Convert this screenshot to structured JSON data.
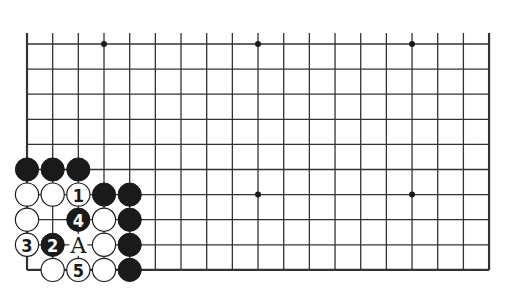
{
  "diagram": {
    "type": "go-board",
    "columns": 19,
    "visible_rows": 10,
    "origin_x": 27,
    "origin_y": 44,
    "spacing_x": 25.67,
    "spacing_y": 25.1,
    "line_top_extension": 11,
    "colors": {
      "line": "#333333",
      "black": "#1a1a1a",
      "white": "#ffffff",
      "background": "#ffffff"
    },
    "star_points": [
      {
        "col": 3,
        "row": 0
      },
      {
        "col": 9,
        "row": 0
      },
      {
        "col": 15,
        "row": 0
      },
      {
        "col": 9,
        "row": 6
      },
      {
        "col": 15,
        "row": 6
      }
    ],
    "stones": [
      {
        "col": 0,
        "row": 5,
        "color": "black",
        "label": ""
      },
      {
        "col": 1,
        "row": 5,
        "color": "black",
        "label": ""
      },
      {
        "col": 2,
        "row": 5,
        "color": "black",
        "label": ""
      },
      {
        "col": 0,
        "row": 6,
        "color": "white",
        "label": ""
      },
      {
        "col": 1,
        "row": 6,
        "color": "white",
        "label": ""
      },
      {
        "col": 2,
        "row": 6,
        "color": "white",
        "label": "1"
      },
      {
        "col": 3,
        "row": 6,
        "color": "black",
        "label": ""
      },
      {
        "col": 4,
        "row": 6,
        "color": "black",
        "label": ""
      },
      {
        "col": 0,
        "row": 7,
        "color": "white",
        "label": ""
      },
      {
        "col": 2,
        "row": 7,
        "color": "black",
        "label": "4"
      },
      {
        "col": 3,
        "row": 7,
        "color": "white",
        "label": ""
      },
      {
        "col": 4,
        "row": 7,
        "color": "black",
        "label": ""
      },
      {
        "col": 0,
        "row": 8,
        "color": "white",
        "label": "3"
      },
      {
        "col": 1,
        "row": 8,
        "color": "black",
        "label": "2"
      },
      {
        "col": 3,
        "row": 8,
        "color": "white",
        "label": ""
      },
      {
        "col": 4,
        "row": 8,
        "color": "black",
        "label": ""
      },
      {
        "col": 1,
        "row": 9,
        "color": "white",
        "label": ""
      },
      {
        "col": 2,
        "row": 9,
        "color": "white",
        "label": "5"
      },
      {
        "col": 3,
        "row": 9,
        "color": "white",
        "label": ""
      },
      {
        "col": 4,
        "row": 9,
        "color": "black",
        "label": ""
      }
    ],
    "markers": [
      {
        "col": 2,
        "row": 8,
        "label": "A"
      }
    ]
  }
}
